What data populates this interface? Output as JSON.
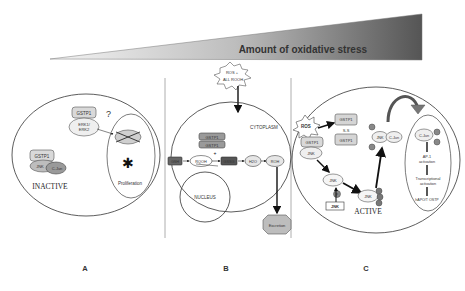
{
  "header": {
    "title": "Amount of oxidative stress",
    "wedge_colors": {
      "light": "#f4f4f4",
      "dark": "#555555"
    }
  },
  "panels": [
    {
      "id": "A",
      "label": "A",
      "state": "INACTIVE",
      "question_mark": "?",
      "complex1": {
        "top": "GSTP1",
        "bottom": "ERK1/ ERK2"
      },
      "complex2": {
        "top": "GSTP1",
        "left": "JNK",
        "right": "C-Jun"
      },
      "inner": {
        "label": "Proliferation",
        "blocked_symbol": "✱"
      }
    },
    {
      "id": "B",
      "label": "B",
      "stimulus": {
        "line1": "ROS +",
        "line2": "ALL ROOH"
      },
      "compartments": {
        "cytoplasm": "CYTOPLASM",
        "nucleus": "NUCLEUS"
      },
      "stack": [
        "GSTP1",
        "GSTP1"
      ],
      "pathway": [
        "GSH",
        "RQOH",
        "GSSG",
        "H2O",
        "ROH"
      ],
      "excretion": "Excretion"
    },
    {
      "id": "C",
      "label": "C",
      "state": "ACTIVE",
      "stimulus": {
        "line1": "ROS",
        "line2": "---"
      },
      "dimer": {
        "top": "GSTP1",
        "link": "S-S",
        "bottom": "GSTP1"
      },
      "left_complex": {
        "top": "GSTP1",
        "bottom": "JNK"
      },
      "jnk_mid": "JNK",
      "jnk_box": "JNK",
      "jnk_active": "JNK",
      "phospho": "P",
      "jnk_cjun": {
        "left": "JNK",
        "right": "C-Jun"
      },
      "nucleus": {
        "cjun": "C-Jun",
        "steps": [
          "AP-1 activation",
          "Transcriptional activation",
          "hAPO/T OSTP"
        ]
      }
    }
  ]
}
